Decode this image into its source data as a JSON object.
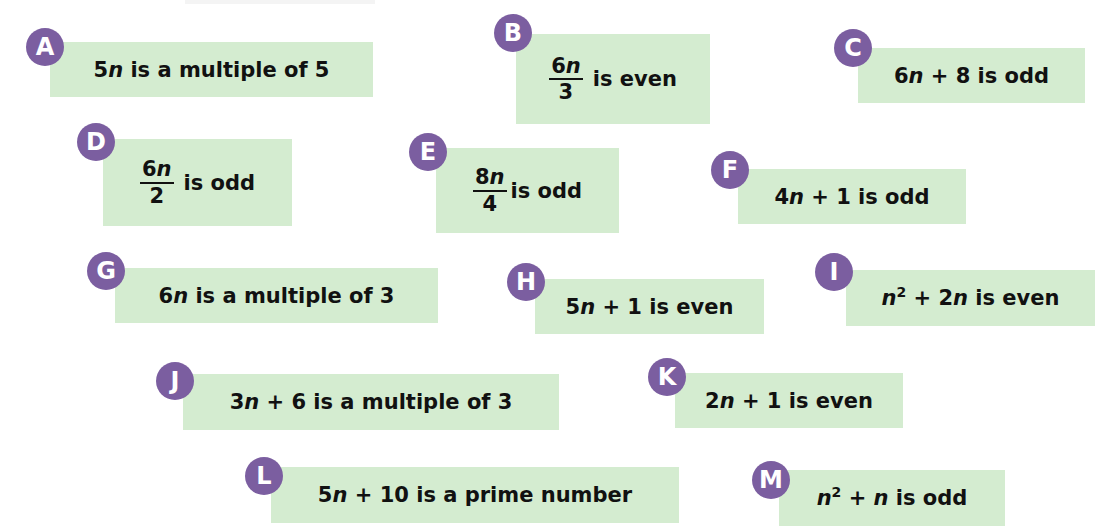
{
  "statements": [
    {
      "label": "A",
      "parts": {
        "a": "5",
        "v": "n",
        "b": " is a multiple of 5"
      }
    },
    {
      "label": "B",
      "fraction": {
        "num_coef": "6",
        "num_var": "n",
        "den": "3"
      },
      "text": "is even"
    },
    {
      "label": "C",
      "parts": {
        "a": "6",
        "v": "n",
        "b": " + 8 is odd"
      }
    },
    {
      "label": "D",
      "fraction": {
        "num_coef": "6",
        "num_var": "n",
        "den": "2"
      },
      "text": "is odd"
    },
    {
      "label": "E",
      "fraction": {
        "num_coef": "8",
        "num_var": "n",
        "den": "4"
      },
      "text": "is odd"
    },
    {
      "label": "F",
      "parts": {
        "a": "4",
        "v": "n",
        "b": " + 1 is odd"
      }
    },
    {
      "label": "G",
      "parts": {
        "a": "6",
        "v": "n",
        "b": " is a multiple of 3"
      }
    },
    {
      "label": "H",
      "parts": {
        "a": "5",
        "v": "n",
        "b": " + 1 is even"
      }
    },
    {
      "label": "I",
      "parts": {
        "v1": "n",
        "exp": "2",
        "mid": " + 2",
        "v2": "n",
        "b": " is even"
      }
    },
    {
      "label": "J",
      "parts": {
        "a": "3",
        "v": "n",
        "b": " + 6 is a multiple of 3"
      }
    },
    {
      "label": "K",
      "parts": {
        "a": "2",
        "v": "n",
        "b": " + 1 is even"
      }
    },
    {
      "label": "L",
      "parts": {
        "a": "5",
        "v": "n",
        "b": " + 10 is a prime number"
      }
    },
    {
      "label": "M",
      "parts": {
        "v1": "n",
        "exp": "2",
        "mid": " + ",
        "v2": "n",
        "b": " is odd"
      }
    }
  ],
  "colors": {
    "badge": "#7b5ea0",
    "box": "#d4ecd0",
    "text": "#111111"
  }
}
